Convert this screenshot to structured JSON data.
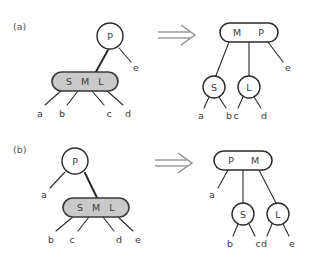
{
  "figure": {
    "background_color": "#ffffff",
    "ink_color": "#2b2b2b",
    "overflow_fill_color": "#c9c9c9",
    "node_fill_color": "#ffffff"
  },
  "panels": [
    {
      "id": "a",
      "label": "(a)",
      "arrow": "⟹",
      "arrow_name": "double-right-arrow",
      "before": {
        "caption": "before",
        "nodes": [
          {
            "id": "a-before-p",
            "shape": "circle",
            "fill": "white",
            "keys": [
              "P"
            ]
          },
          {
            "id": "a-before-sml",
            "shape": "rounded-rect",
            "fill": "gray",
            "keys": [
              "S",
              "M",
              "L"
            ]
          }
        ],
        "leaves": [
          "a",
          "b",
          "c",
          "d",
          "e"
        ]
      },
      "after": {
        "caption": "after",
        "nodes": [
          {
            "id": "a-after-mp",
            "shape": "rounded-rect",
            "fill": "white",
            "keys": [
              "M",
              "P"
            ]
          },
          {
            "id": "a-after-s",
            "shape": "circle",
            "fill": "white",
            "keys": [
              "S"
            ]
          },
          {
            "id": "a-after-l",
            "shape": "circle",
            "fill": "white",
            "keys": [
              "L"
            ]
          }
        ],
        "leaves": [
          "a",
          "b",
          "c",
          "d",
          "e"
        ]
      }
    },
    {
      "id": "b",
      "label": "(b)",
      "arrow": "⟹",
      "arrow_name": "double-right-arrow",
      "before": {
        "caption": "before",
        "nodes": [
          {
            "id": "b-before-p",
            "shape": "circle",
            "fill": "white",
            "keys": [
              "P"
            ]
          },
          {
            "id": "b-before-sml",
            "shape": "rounded-rect",
            "fill": "gray",
            "keys": [
              "S",
              "M",
              "L"
            ]
          }
        ],
        "leaves": [
          "a",
          "b",
          "c",
          "d",
          "e"
        ]
      },
      "after": {
        "caption": "after",
        "nodes": [
          {
            "id": "b-after-pm",
            "shape": "rounded-rect",
            "fill": "white",
            "keys": [
              "P",
              "M"
            ]
          },
          {
            "id": "b-after-s",
            "shape": "circle",
            "fill": "white",
            "keys": [
              "S"
            ]
          },
          {
            "id": "b-after-l",
            "shape": "circle",
            "fill": "white",
            "keys": [
              "L"
            ]
          }
        ],
        "leaves": [
          "a",
          "b",
          "c",
          "d",
          "e"
        ]
      }
    }
  ],
  "panel_a": {
    "label": "(a)",
    "left": {
      "root_key": "P",
      "root_right_leaf": "e",
      "overflow_keys": {
        "k1": "S",
        "k2": "M",
        "k3": "L"
      },
      "leaves": {
        "l1": "a",
        "l2": "b",
        "l3": "c",
        "l4": "d"
      }
    },
    "right": {
      "root_keys": {
        "k1": "M",
        "k2": "P"
      },
      "root_right_leaf": "e",
      "child_left_key": "S",
      "child_right_key": "L",
      "leaves": {
        "l1": "a",
        "l2": "b",
        "l3": "c",
        "l4": "d"
      }
    }
  },
  "panel_b": {
    "label": "(b)",
    "left": {
      "root_key": "P",
      "root_left_leaf": "a",
      "overflow_keys": {
        "k1": "S",
        "k2": "M",
        "k3": "L"
      },
      "leaves": {
        "l1": "b",
        "l2": "c",
        "l3": "d",
        "l4": "e"
      }
    },
    "right": {
      "root_keys": {
        "k1": "P",
        "k2": "M"
      },
      "root_left_leaf": "a",
      "child_left_key": "S",
      "child_right_key": "L",
      "leaves": {
        "l1": "b",
        "l2": "c",
        "l3": "d",
        "l4": "e"
      }
    }
  }
}
